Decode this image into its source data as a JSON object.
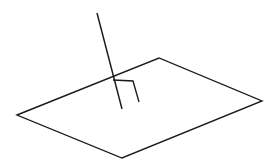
{
  "canvas": {
    "width": 276,
    "height": 168,
    "background_color": "#ffffff",
    "stroke_color": "#1a1a1a",
    "stroke_width": 1.35
  },
  "figure": {
    "title": "Line perpendicular to a plane"
  },
  "chart_data": {
    "type": "diagram",
    "title": "Line perpendicular to a plane",
    "xlabel": "",
    "ylabel": "",
    "xlim": [
      0,
      276
    ],
    "ylim": [
      0,
      168
    ],
    "grid": false,
    "legend": null,
    "shapes": [
      {
        "name": "plane-parallelogram",
        "kind": "polygon",
        "closed": true,
        "points": [
          [
            17,
            115
          ],
          [
            159,
            58
          ],
          [
            262,
            101
          ],
          [
            122,
            158
          ]
        ],
        "stroke": "#1a1a1a",
        "fill": "none"
      },
      {
        "name": "perpendicular-line",
        "kind": "polyline",
        "closed": false,
        "points": [
          [
            97,
            13
          ],
          [
            122,
            109
          ]
        ],
        "stroke": "#1a1a1a",
        "fill": "none"
      },
      {
        "name": "right-angle-marker",
        "kind": "polyline",
        "closed": false,
        "points": [
          [
            113,
            80
          ],
          [
            133,
            81
          ],
          [
            139,
            102
          ]
        ],
        "stroke": "#1a1a1a",
        "fill": "none"
      }
    ],
    "annotations": [
      {
        "name": "intersection-point",
        "x": 114,
        "y": 78,
        "label": ""
      }
    ],
    "labels": []
  }
}
